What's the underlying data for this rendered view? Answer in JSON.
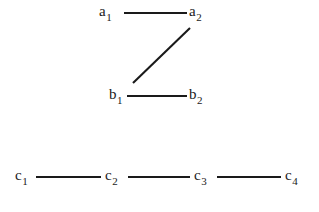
{
  "figure": {
    "background_color": "#ffffff",
    "ink_color": "#1a1a1a"
  },
  "chart_data": {
    "type": "diagram",
    "diagram_kind": "graph",
    "title": "",
    "xlabel": "",
    "ylabel": "",
    "nodes": [
      {
        "id": "a1",
        "base": "a",
        "sub": "1",
        "x": 107,
        "y": 13,
        "row": "a"
      },
      {
        "id": "a2",
        "base": "a",
        "sub": "2",
        "x": 196,
        "y": 13,
        "row": "a"
      },
      {
        "id": "b1",
        "base": "b",
        "sub": "1",
        "x": 117,
        "y": 96,
        "row": "b"
      },
      {
        "id": "b2",
        "base": "b",
        "sub": "2",
        "x": 196,
        "y": 96,
        "row": "b"
      },
      {
        "id": "c1",
        "base": "c",
        "sub": "1",
        "x": 23,
        "y": 177,
        "row": "c"
      },
      {
        "id": "c2",
        "base": "c",
        "sub": "2",
        "x": 113,
        "y": 177,
        "row": "c"
      },
      {
        "id": "c3",
        "base": "c",
        "sub": "3",
        "x": 202,
        "y": 177,
        "row": "c"
      },
      {
        "id": "c4",
        "base": "c",
        "sub": "4",
        "x": 293,
        "y": 177,
        "row": "c"
      }
    ],
    "edges": [
      {
        "from": "a1",
        "to": "a2",
        "x1": 124,
        "y1": 13,
        "x2": 187,
        "y2": 13
      },
      {
        "from": "b1",
        "to": "a2",
        "x1": 133,
        "y1": 83,
        "x2": 190,
        "y2": 28
      },
      {
        "from": "b1",
        "to": "b2",
        "x1": 127,
        "y1": 96,
        "x2": 187,
        "y2": 96
      },
      {
        "from": "c1",
        "to": "c2",
        "x1": 36,
        "y1": 177,
        "x2": 101,
        "y2": 177
      },
      {
        "from": "c2",
        "to": "c3",
        "x1": 128,
        "y1": 177,
        "x2": 190,
        "y2": 177
      },
      {
        "from": "c3",
        "to": "c4",
        "x1": 217,
        "y1": 177,
        "x2": 281,
        "y2": 177
      }
    ],
    "components": [
      {
        "name": "component-1",
        "nodes": [
          "a1",
          "a2",
          "b1",
          "b2"
        ]
      },
      {
        "name": "component-2",
        "nodes": [
          "c1",
          "c2",
          "c3",
          "c4"
        ]
      }
    ]
  }
}
